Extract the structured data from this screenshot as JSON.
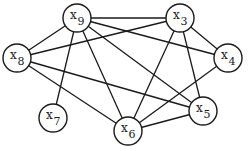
{
  "diagram": {
    "type": "undirected-graph",
    "nodes": [
      {
        "id": "x9",
        "base": "x",
        "sub": "9",
        "cx": 77,
        "cy": 18
      },
      {
        "id": "x3",
        "base": "x",
        "sub": "3",
        "cx": 180,
        "cy": 18
      },
      {
        "id": "x8",
        "base": "x",
        "sub": "8",
        "cx": 17,
        "cy": 58
      },
      {
        "id": "x4",
        "base": "x",
        "sub": "4",
        "cx": 228,
        "cy": 58
      },
      {
        "id": "x7",
        "base": "x",
        "sub": "7",
        "cx": 53,
        "cy": 118
      },
      {
        "id": "x5",
        "base": "x",
        "sub": "5",
        "cx": 203,
        "cy": 111
      },
      {
        "id": "x6",
        "base": "x",
        "sub": "6",
        "cx": 128,
        "cy": 131
      }
    ],
    "edges": [
      [
        "x9",
        "x3"
      ],
      [
        "x9",
        "x8"
      ],
      [
        "x9",
        "x7"
      ],
      [
        "x9",
        "x6"
      ],
      [
        "x9",
        "x5"
      ],
      [
        "x9",
        "x4"
      ],
      [
        "x3",
        "x8"
      ],
      [
        "x3",
        "x4"
      ],
      [
        "x3",
        "x6"
      ],
      [
        "x3",
        "x5"
      ],
      [
        "x8",
        "x5"
      ],
      [
        "x8",
        "x6"
      ],
      [
        "x4",
        "x6"
      ],
      [
        "x6",
        "x5"
      ]
    ],
    "node_radius": 14
  }
}
